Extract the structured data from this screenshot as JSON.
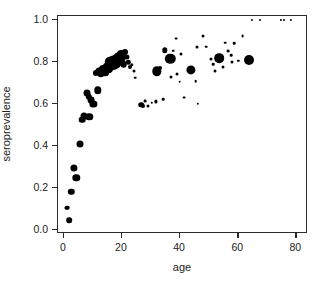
{
  "chart_data": {
    "type": "scatter",
    "title": "",
    "xlabel": "age",
    "ylabel": "seroprevalence",
    "xlim": [
      -2,
      84
    ],
    "ylim": [
      -0.02,
      1.02
    ],
    "grid": false,
    "legend": null,
    "x_ticks": [
      "0",
      "20",
      "40",
      "60",
      "80"
    ],
    "x_tick_values": [
      0,
      20,
      40,
      60,
      80
    ],
    "y_ticks": [
      "0.0",
      "0.2",
      "0.4",
      "0.6",
      "0.8",
      "1.0"
    ],
    "y_tick_values": [
      0.0,
      0.2,
      0.4,
      0.6,
      0.8,
      1.0
    ],
    "marker_color": "#000000",
    "marker_note": "point area proportional to sample size (bubble scatter)",
    "points": [
      {
        "x": 0.6,
        "y": 0.105,
        "size": 3.0
      },
      {
        "x": 1.2,
        "y": 0.105,
        "size": 4.6
      },
      {
        "x": 1.8,
        "y": 0.047,
        "size": 5.6
      },
      {
        "x": 2.6,
        "y": 0.182,
        "size": 6.4
      },
      {
        "x": 3.4,
        "y": 0.295,
        "size": 7.2
      },
      {
        "x": 4.3,
        "y": 0.249,
        "size": 7.4
      },
      {
        "x": 5.6,
        "y": 0.409,
        "size": 7.0
      },
      {
        "x": 6.4,
        "y": 0.525,
        "size": 6.6
      },
      {
        "x": 6.9,
        "y": 0.545,
        "size": 7.0
      },
      {
        "x": 8.8,
        "y": 0.539,
        "size": 7.4
      },
      {
        "x": 8.0,
        "y": 0.653,
        "size": 7.0
      },
      {
        "x": 8.6,
        "y": 0.635,
        "size": 6.4
      },
      {
        "x": 9.3,
        "y": 0.618,
        "size": 6.8
      },
      {
        "x": 10.2,
        "y": 0.6,
        "size": 7.2
      },
      {
        "x": 11.6,
        "y": 0.665,
        "size": 7.4
      },
      {
        "x": 11.0,
        "y": 0.748,
        "size": 6.2
      },
      {
        "x": 12.0,
        "y": 0.757,
        "size": 7.0
      },
      {
        "x": 12.8,
        "y": 0.745,
        "size": 7.4
      },
      {
        "x": 13.5,
        "y": 0.766,
        "size": 8.2
      },
      {
        "x": 14.2,
        "y": 0.752,
        "size": 7.6
      },
      {
        "x": 14.9,
        "y": 0.779,
        "size": 9.0
      },
      {
        "x": 15.4,
        "y": 0.772,
        "size": 9.6
      },
      {
        "x": 15.9,
        "y": 0.8,
        "size": 10.4
      },
      {
        "x": 16.4,
        "y": 0.784,
        "size": 10.0
      },
      {
        "x": 16.9,
        "y": 0.806,
        "size": 10.8
      },
      {
        "x": 17.3,
        "y": 0.789,
        "size": 10.2
      },
      {
        "x": 17.8,
        "y": 0.812,
        "size": 10.4
      },
      {
        "x": 18.2,
        "y": 0.796,
        "size": 9.6
      },
      {
        "x": 18.7,
        "y": 0.826,
        "size": 9.0
      },
      {
        "x": 19.1,
        "y": 0.805,
        "size": 8.4
      },
      {
        "x": 19.6,
        "y": 0.838,
        "size": 8.0
      },
      {
        "x": 20.1,
        "y": 0.818,
        "size": 7.2
      },
      {
        "x": 20.6,
        "y": 0.789,
        "size": 6.6
      },
      {
        "x": 21.2,
        "y": 0.848,
        "size": 6.0
      },
      {
        "x": 21.7,
        "y": 0.826,
        "size": 5.2
      },
      {
        "x": 22.2,
        "y": 0.8,
        "size": 4.4
      },
      {
        "x": 22.8,
        "y": 0.776,
        "size": 4.0
      },
      {
        "x": 23.4,
        "y": 0.788,
        "size": 3.4
      },
      {
        "x": 24.0,
        "y": 0.76,
        "size": 3.0
      },
      {
        "x": 24.6,
        "y": 0.726,
        "size": 2.6
      },
      {
        "x": 26.6,
        "y": 0.597,
        "size": 5.6
      },
      {
        "x": 27.2,
        "y": 0.592,
        "size": 4.0
      },
      {
        "x": 28.0,
        "y": 0.614,
        "size": 2.8
      },
      {
        "x": 28.8,
        "y": 0.59,
        "size": 3.0
      },
      {
        "x": 30.2,
        "y": 0.605,
        "size": 2.4
      },
      {
        "x": 31.6,
        "y": 0.613,
        "size": 3.2
      },
      {
        "x": 32.0,
        "y": 0.757,
        "size": 9.4
      },
      {
        "x": 33.0,
        "y": 0.771,
        "size": 4.0
      },
      {
        "x": 34.2,
        "y": 0.624,
        "size": 2.6
      },
      {
        "x": 34.8,
        "y": 0.856,
        "size": 5.4
      },
      {
        "x": 36.6,
        "y": 0.817,
        "size": 10.4
      },
      {
        "x": 37.0,
        "y": 0.729,
        "size": 3.0
      },
      {
        "x": 37.6,
        "y": 0.855,
        "size": 2.6
      },
      {
        "x": 38.6,
        "y": 0.912,
        "size": 2.8
      },
      {
        "x": 39.0,
        "y": 0.745,
        "size": 3.0
      },
      {
        "x": 39.8,
        "y": 0.706,
        "size": 2.6
      },
      {
        "x": 40.4,
        "y": 0.841,
        "size": 3.0
      },
      {
        "x": 41.5,
        "y": 0.631,
        "size": 2.8
      },
      {
        "x": 43.8,
        "y": 0.764,
        "size": 9.2
      },
      {
        "x": 45.4,
        "y": 0.708,
        "size": 2.6
      },
      {
        "x": 46.0,
        "y": 0.602,
        "size": 2.4
      },
      {
        "x": 45.8,
        "y": 0.873,
        "size": 3.0
      },
      {
        "x": 47.8,
        "y": 0.926,
        "size": 3.0
      },
      {
        "x": 49.0,
        "y": 0.874,
        "size": 2.6
      },
      {
        "x": 50.6,
        "y": 0.815,
        "size": 3.0
      },
      {
        "x": 51.4,
        "y": 0.789,
        "size": 2.6
      },
      {
        "x": 52.0,
        "y": 0.76,
        "size": 3.0
      },
      {
        "x": 53.4,
        "y": 0.818,
        "size": 9.6
      },
      {
        "x": 54.6,
        "y": 0.776,
        "size": 3.0
      },
      {
        "x": 55.6,
        "y": 0.893,
        "size": 2.6
      },
      {
        "x": 56.6,
        "y": 0.851,
        "size": 2.8
      },
      {
        "x": 57.6,
        "y": 0.833,
        "size": 2.6
      },
      {
        "x": 58.0,
        "y": 0.802,
        "size": 3.0
      },
      {
        "x": 58.6,
        "y": 0.89,
        "size": 2.6
      },
      {
        "x": 60.0,
        "y": 0.806,
        "size": 2.4
      },
      {
        "x": 61.5,
        "y": 0.925,
        "size": 2.8
      },
      {
        "x": 63.6,
        "y": 0.809,
        "size": 10.0
      },
      {
        "x": 64.8,
        "y": 1.0,
        "size": 2.2
      },
      {
        "x": 67.6,
        "y": 1.0,
        "size": 2.0
      },
      {
        "x": 74.6,
        "y": 1.0,
        "size": 2.2
      },
      {
        "x": 75.6,
        "y": 1.0,
        "size": 2.0
      },
      {
        "x": 78.0,
        "y": 1.0,
        "size": 2.2
      }
    ]
  },
  "axes": {
    "x_label": "age",
    "y_label": "seroprevalence"
  }
}
